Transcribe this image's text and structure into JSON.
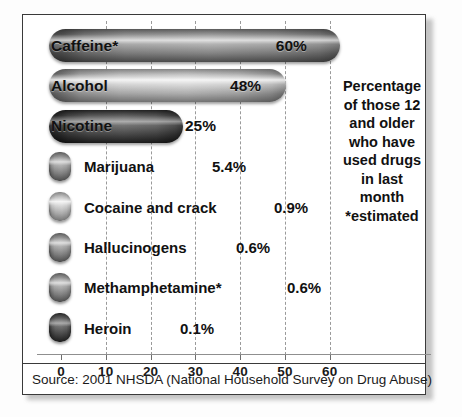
{
  "chart_data": {
    "type": "bar",
    "orientation": "horizontal",
    "title": "",
    "caption": "Percentage of those 12 and older who have used drugs in last month *estimated",
    "caption_lines": [
      "Percentage",
      "of those 12",
      "and older",
      "who have",
      "used drugs",
      "in last",
      "month",
      "*estimated"
    ],
    "categories": [
      "Caffeine*",
      "Alcohol",
      "Nicotine",
      "Marijuana",
      "Cocaine and crack",
      "Hallucinogens",
      "Methamphetamine*",
      "Heroin"
    ],
    "values": [
      60,
      48,
      25,
      5.4,
      0.9,
      0.6,
      0.6,
      0.1
    ],
    "value_labels": [
      "60%",
      "48%",
      "25%",
      "5.4%",
      "0.9%",
      "0.6%",
      "0.6%",
      "0.1%"
    ],
    "xlabel": "",
    "ylabel": "",
    "xlim": [
      0,
      70
    ],
    "xticks": [
      0,
      10,
      20,
      30,
      40,
      50,
      60
    ],
    "xtick_labels": [
      "0",
      "10",
      "20",
      "30",
      "40",
      "50",
      "60"
    ],
    "grid": true,
    "grid_style": "dashed-vertical",
    "legend": "none",
    "source": "Source: 2001 NHSDA (National Household Survey on Drug Abuse)",
    "bars": [
      {
        "label": "Caffeine*",
        "value": 60,
        "value_label": "60%",
        "label_inside": true,
        "shade": "mid"
      },
      {
        "label": "Alcohol",
        "value": 48,
        "value_label": "48%",
        "label_inside": true,
        "shade": "light"
      },
      {
        "label": "Nicotine",
        "value": 25,
        "value_label": "25%",
        "label_inside": true,
        "shade": "dark"
      },
      {
        "label": "Marijuana",
        "value": 5.4,
        "value_label": "5.4%",
        "label_inside": false,
        "shade": "mid"
      },
      {
        "label": "Cocaine and crack",
        "value": 0.9,
        "value_label": "0.9%",
        "label_inside": false,
        "shade": "light"
      },
      {
        "label": "Hallucinogens",
        "value": 0.6,
        "value_label": "0.6%",
        "label_inside": false,
        "shade": "mid"
      },
      {
        "label": "Methamphetamine*",
        "value": 0.6,
        "value_label": "0.6%",
        "label_inside": false,
        "shade": "mid"
      },
      {
        "label": "Heroin",
        "value": 0.1,
        "value_label": "0.1%",
        "label_inside": false,
        "shade": "dark"
      }
    ]
  },
  "colors": {
    "frame": "#3a3a3a",
    "background": "#ffffff",
    "text": "#111111",
    "grid": "#9a9a9a",
    "axis": "#8f8f8f"
  }
}
